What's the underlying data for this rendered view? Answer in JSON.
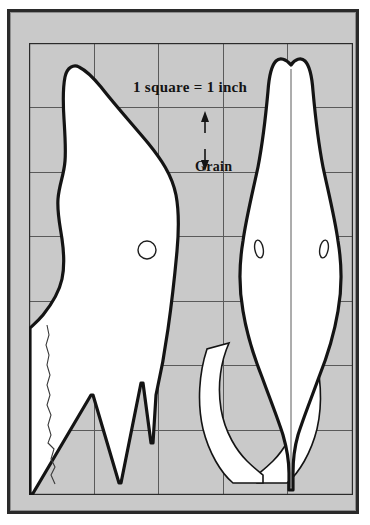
{
  "figure": {
    "type": "woodworking-pattern",
    "background_color": "#c9c9c9",
    "paper_color": "#ffffff",
    "ink_color": "#141414",
    "grid_line_color": "#5a5a5a",
    "scale_caption": "1 square = 1 inch",
    "grain_label": "Grain",
    "grid": {
      "columns": 5,
      "rows": 7,
      "square_inches": 1,
      "x_lines": [
        0,
        65,
        129,
        194,
        258,
        323
      ],
      "y_lines": [
        0,
        64,
        129,
        193,
        258,
        322,
        387,
        451
      ]
    },
    "views": [
      {
        "name": "side-profile-view",
        "label": "side profile",
        "eye": {
          "cx": 118,
          "cy": 207,
          "r": 9,
          "shape": "circle"
        }
      },
      {
        "name": "top-plan-view",
        "label": "top plan",
        "eyes": [
          {
            "cx": 230,
            "cy": 206,
            "rx": 4.2,
            "ry": 9,
            "rot": -10
          },
          {
            "cx": 295,
            "cy": 206,
            "rx": 4.2,
            "ry": 9,
            "rot": 10
          }
        ]
      }
    ],
    "grain_arrow": {
      "x": 176,
      "y_top": 70,
      "y_bottom": 126,
      "direction": "vertical-double-headed"
    }
  }
}
